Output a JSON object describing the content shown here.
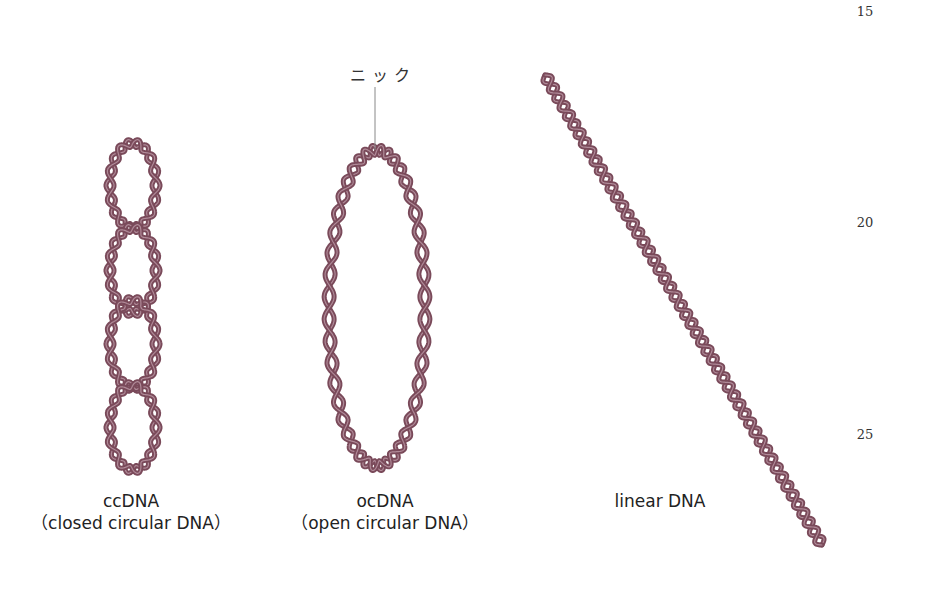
{
  "line_numbers": [
    "15",
    "20",
    "25"
  ],
  "annotation": {
    "nick_label": "ニック"
  },
  "forms": [
    {
      "id": "ccDNA",
      "name": "ccDNA",
      "subtitle": "（closed circular DNA）",
      "shape": "supercoiled-loops",
      "loop_count": 4
    },
    {
      "id": "ocDNA",
      "name": "ocDNA",
      "subtitle": "（open circular DNA）",
      "shape": "relaxed-oval"
    },
    {
      "id": "linear",
      "name": "linear DNA",
      "subtitle": "",
      "shape": "straight-diagonal"
    }
  ],
  "colors": {
    "strand": "#7a4a5a",
    "strand_light": "#b08a98",
    "text": "#222222",
    "pointer": "#888888"
  }
}
